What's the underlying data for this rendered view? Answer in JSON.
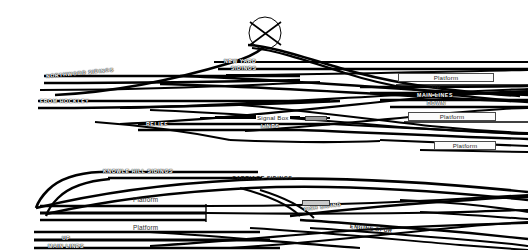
{
  "diagram": {
    "colors": {
      "track": "#000000",
      "background": "#ffffff",
      "platform_fill": "#fbfbfb",
      "platform_border": "#4a4a4a",
      "signal_box_fill": "#9a9a9a"
    },
    "upper_section": {
      "labels": [
        {
          "id": "northwood-sidings",
          "text": "NORTHWOOD SIDINGS",
          "x": 46,
          "y": 77,
          "style": "inline",
          "rotate": "rot-up"
        },
        {
          "id": "from-hockley",
          "text": "FROM HOCKLEY",
          "x": 40,
          "y": 103,
          "style": "inline",
          "rotate": "none"
        },
        {
          "id": "new-yard",
          "text": "NEW YARD",
          "x": 224,
          "y": 62,
          "style": "inline",
          "rotate": "none"
        },
        {
          "id": "new-yard-sidings",
          "text": "SIDINGS",
          "x": 231,
          "y": 70,
          "style": "inline",
          "rotate": "none"
        },
        {
          "id": "up-main",
          "text": "UP",
          "x": 432,
          "y": 89,
          "style": "plain",
          "rotate": "none"
        },
        {
          "id": "main-lines",
          "text": "MAIN LINES",
          "x": 417,
          "y": 97,
          "style": "inline",
          "rotate": "none"
        },
        {
          "id": "down-main",
          "text": "DOWN",
          "x": 427,
          "y": 105,
          "style": "inline",
          "rotate": "none"
        },
        {
          "id": "relief",
          "text": "RELIEF",
          "x": 146,
          "y": 126,
          "style": "inline",
          "rotate": "none"
        },
        {
          "id": "lines",
          "text": "LINES",
          "x": 261,
          "y": 128,
          "style": "inline",
          "rotate": "none"
        },
        {
          "id": "signal-box",
          "text": "Signal Box",
          "x": 256,
          "y": 119,
          "style": "plainmixed",
          "rotate": "none"
        }
      ],
      "platforms": [
        {
          "id": "platform-upper-1",
          "text": "Platform",
          "x": 398,
          "y": 73,
          "w": 96,
          "h": 9
        },
        {
          "id": "platform-upper-2",
          "text": "Platform",
          "x": 408,
          "y": 112,
          "w": 88,
          "h": 9
        },
        {
          "id": "platform-upper-3",
          "text": "Platform",
          "x": 434,
          "y": 141,
          "w": 62,
          "h": 9
        }
      ],
      "signal_box_marker": {
        "id": "signal-box-marker",
        "x": 305,
        "y": 117,
        "w": 22,
        "h": 5
      },
      "junction_circle": {
        "id": "crossover-circle",
        "cx": 265,
        "cy": 33,
        "r": 16
      }
    },
    "lower_section": {
      "labels": [
        {
          "id": "knowle-hill-sidings",
          "text": "KNOWLE HILL SIDINGS",
          "x": 103,
          "y": 172,
          "style": "inline",
          "rotate": "none"
        },
        {
          "id": "carriage-sidings",
          "text": "CARRIAGE SIDINGS",
          "x": 232,
          "y": 179,
          "style": "plain",
          "rotate": "none"
        },
        {
          "id": "fish-siding",
          "text": "FISH SIDING",
          "x": 304,
          "y": 210,
          "style": "inline",
          "rotate": "rot-up2"
        },
        {
          "id": "engine-spur",
          "text": "ENGINE SPUR",
          "x": 350,
          "y": 227,
          "style": "plain",
          "rotate": "rot-dn2"
        },
        {
          "id": "up-lower",
          "text": "UP",
          "x": 62,
          "y": 239,
          "style": "inline",
          "rotate": "none"
        },
        {
          "id": "main-lines-lower",
          "text": "MAIN LINES",
          "x": 48,
          "y": 247,
          "style": "inline",
          "rotate": "none"
        }
      ],
      "platforms": [
        {
          "id": "platform-lower-1",
          "text": "Platform",
          "x": 133,
          "y": 196,
          "w": 42,
          "h": 9
        },
        {
          "id": "platform-lower-2",
          "text": "Platform",
          "x": 133,
          "y": 224,
          "w": 42,
          "h": 9
        }
      ],
      "grey_marker": {
        "id": "fish-siding-marker",
        "x": 302,
        "y": 200,
        "w": 28,
        "h": 6
      }
    }
  }
}
